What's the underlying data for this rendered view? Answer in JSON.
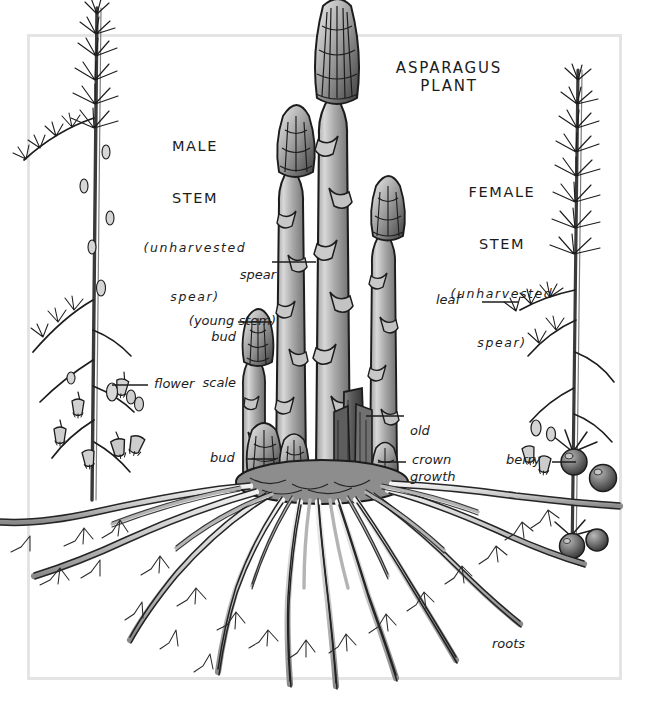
{
  "figure": {
    "title": "ASPARAGUS PLANT",
    "frame_color": "#e3e3e3",
    "ink_color": "#1c1c1c",
    "background": "#ffffff"
  },
  "labels": {
    "title": {
      "text": "ASPARAGUS\nPLANT",
      "style": "caps"
    },
    "male_stem": {
      "line1": "MALE",
      "line2": "STEM",
      "line3": "(unharvested",
      "line4": "spear)"
    },
    "female_stem": {
      "line1": "FEMALE",
      "line2": "STEM",
      "line3": "(unharvested",
      "line4": "spear)"
    },
    "spear": {
      "line1": "spear",
      "line2": "(young stem)"
    },
    "bud_scale": {
      "line1": "bud",
      "line2": "scale"
    },
    "flower": {
      "text": "flower"
    },
    "leaf": {
      "text": "leaf"
    },
    "old_growth": {
      "line1": "old",
      "line2": "growth"
    },
    "bud": {
      "text": "bud"
    },
    "crown": {
      "text": "crown"
    },
    "berry": {
      "text": "berry"
    },
    "roots": {
      "text": "roots"
    }
  },
  "parts": [
    {
      "name": "male-stem",
      "label": "MALE STEM (unharvested spear)"
    },
    {
      "name": "female-stem",
      "label": "FEMALE STEM (unharvested spear)"
    },
    {
      "name": "spear",
      "label": "spear (young stem)"
    },
    {
      "name": "bud-scale",
      "label": "bud scale"
    },
    {
      "name": "flower",
      "label": "flower"
    },
    {
      "name": "leaf",
      "label": "leaf"
    },
    {
      "name": "old-growth",
      "label": "old growth"
    },
    {
      "name": "bud",
      "label": "bud"
    },
    {
      "name": "crown",
      "label": "crown"
    },
    {
      "name": "berry",
      "label": "berry"
    },
    {
      "name": "roots",
      "label": "roots"
    }
  ]
}
